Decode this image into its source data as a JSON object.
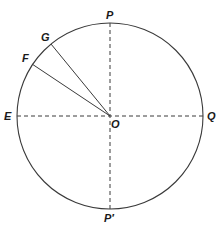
{
  "diagram": {
    "type": "circle-geometry",
    "colors": {
      "stroke": "#3a3a3a",
      "text": "#1a1a1a",
      "background": "#ffffff"
    },
    "circle": {
      "cx": 110,
      "cy": 116,
      "r": 93
    },
    "center_label": "O",
    "points": {
      "P": {
        "label": "P",
        "x": 110,
        "y": 23
      },
      "P_prime": {
        "label": "P′",
        "x": 110,
        "y": 209
      },
      "E": {
        "label": "E",
        "x": 17,
        "y": 116
      },
      "Q": {
        "label": "Q",
        "x": 203,
        "y": 116
      },
      "G": {
        "label": "G",
        "x": 51,
        "y": 44
      },
      "F": {
        "label": "F",
        "x": 32,
        "y": 64
      }
    },
    "segments": [
      {
        "from": "P",
        "to": "P_prime",
        "style": "dashed",
        "desc": "vertical diameter"
      },
      {
        "from": "E",
        "to": "Q",
        "style": "dashed",
        "desc": "horizontal diameter"
      },
      {
        "from": "O",
        "to": "G",
        "style": "solid",
        "desc": "radius OG"
      },
      {
        "from": "O",
        "to": "F",
        "style": "solid",
        "desc": "radius OF"
      }
    ]
  }
}
